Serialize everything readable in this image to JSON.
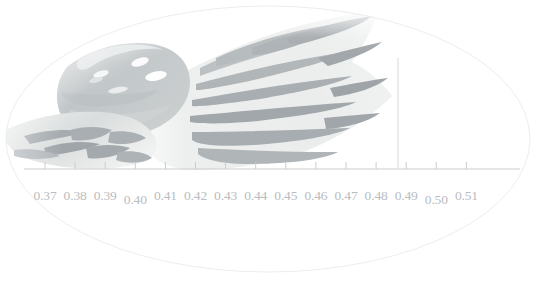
{
  "figure": {
    "title": "",
    "background_color": "#ffffff",
    "ellipse_frame": {
      "name": "ellipse-vignette",
      "center_x": 268,
      "center_y": 139,
      "radius_x": 262,
      "radius_y": 133,
      "stroke_color": "#ededf0",
      "stroke_width": 1,
      "fill": "none"
    },
    "marker_line": {
      "name": "vertical-measurement-marker",
      "x": 398,
      "y_top": 58,
      "y_bottom": 168,
      "color": "#d6d8db",
      "width": 1
    }
  },
  "axis": {
    "name": "measurement-axis",
    "line_color": "#c9ccd0",
    "line_width": 1,
    "x_start": 24,
    "x_end": 520,
    "y": 169,
    "tick_color": "#c9ccd0",
    "tick_length": 7,
    "tick_start_x": 45,
    "tick_spacing": 30.1,
    "label_color": "#b9bcc0",
    "label_font_size": 13.5,
    "ticks": [
      {
        "label": "0.37",
        "value": 0.37,
        "x": 45,
        "label_y": 189
      },
      {
        "label": "0.38",
        "value": 0.38,
        "x": 75.1,
        "label_y": 189
      },
      {
        "label": "0.39",
        "value": 0.39,
        "x": 105.2,
        "label_y": 189
      },
      {
        "label": "0.40",
        "value": 0.4,
        "x": 135.3,
        "label_y": 193
      },
      {
        "label": "0.41",
        "value": 0.41,
        "x": 165.4,
        "label_y": 189
      },
      {
        "label": "0.42",
        "value": 0.42,
        "x": 195.5,
        "label_y": 189
      },
      {
        "label": "0.43",
        "value": 0.43,
        "x": 225.6,
        "label_y": 189
      },
      {
        "label": "0.44",
        "value": 0.44,
        "x": 255.7,
        "label_y": 189
      },
      {
        "label": "0.45",
        "value": 0.45,
        "x": 285.8,
        "label_y": 189
      },
      {
        "label": "0.46",
        "value": 0.46,
        "x": 315.9,
        "label_y": 189
      },
      {
        "label": "0.47",
        "value": 0.47,
        "x": 346.0,
        "label_y": 189
      },
      {
        "label": "0.48",
        "value": 0.48,
        "x": 376.1,
        "label_y": 189
      },
      {
        "label": "0.49",
        "value": 0.49,
        "x": 406.2,
        "label_y": 189
      },
      {
        "label": "0.50",
        "value": 0.5,
        "x": 436.3,
        "label_y": 193
      },
      {
        "label": "0.51",
        "value": 0.51,
        "x": 466.4,
        "label_y": 189
      }
    ],
    "range_min": 0.37,
    "range_max": 0.51
  },
  "specimen": {
    "name": "fish-caudal-fin",
    "description": "washed-out photograph of a forked fish tail with dark radiating stripes",
    "colors": {
      "membrane_light": "#f3f4f4",
      "membrane_mid": "#e6e8e8",
      "stripe_dark": "#a8adb0",
      "stripe_mid": "#c4c8ca",
      "peduncle_body": "#c3c7c8",
      "peduncle_shadow": "#b0b5b7",
      "highlight": "#fdfdfd",
      "lower_fin": "#d9dcdc",
      "lower_fin_mark": "#9ea4a7"
    }
  }
}
